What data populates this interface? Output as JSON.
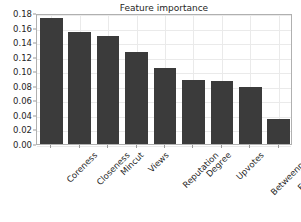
{
  "chart_data": {
    "type": "bar",
    "title": "Feature importance",
    "xlabel": "",
    "ylabel": "",
    "categories": [
      "Coreness",
      "Closeness",
      "Mincut",
      "Views",
      "Reputation",
      "Degree",
      "Upvotes",
      "Betweenness",
      "Eccentricity"
    ],
    "values": [
      0.173,
      0.154,
      0.149,
      0.127,
      0.105,
      0.088,
      0.086,
      0.079,
      0.034
    ],
    "ylim": [
      0.0,
      0.18
    ],
    "ytick_labels": [
      "0.00",
      "0.02",
      "0.04",
      "0.06",
      "0.08",
      "0.10",
      "0.12",
      "0.14",
      "0.16",
      "0.18"
    ],
    "ytick_values": [
      0.0,
      0.02,
      0.04,
      0.06,
      0.08,
      0.1,
      0.12,
      0.14,
      0.16,
      0.18
    ],
    "grid": true,
    "legend": "none",
    "bar_color": "#3b3b3b",
    "background_color": "#ffffff",
    "grid_color": "#eaeaea",
    "axis_color": "#b0b0b0",
    "text_color": "#262626",
    "xtick_rotation": -45
  }
}
